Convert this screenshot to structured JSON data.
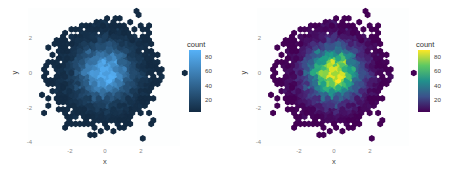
{
  "chart_data": [
    {
      "type": "heatmap",
      "subtype": "hexbin",
      "title": "",
      "xlabel": "x",
      "ylabel": "y",
      "x_ticks": [
        "-2",
        "0",
        "2"
      ],
      "y_ticks": [
        "2",
        "0",
        "-2",
        "-4"
      ],
      "xlim": [
        -3.8,
        3.8
      ],
      "ylim": [
        -4.2,
        3.2
      ],
      "grid": false,
      "legend": {
        "title": "count",
        "position": "right",
        "breaks": [
          "80",
          "60",
          "40",
          "20"
        ],
        "range": [
          1,
          88
        ]
      },
      "palette": {
        "name": "default-blue",
        "low": "#132B43",
        "high": "#56B1F7"
      },
      "description": "2D hexagonal binning of ~10000 bivariate standard normal points; counts peak ~85 near origin and fall off radially to 1 at edges"
    },
    {
      "type": "heatmap",
      "subtype": "hexbin",
      "title": "",
      "xlabel": "x",
      "ylabel": "y",
      "x_ticks": [
        "-2",
        "0",
        "2"
      ],
      "y_ticks": [
        "2",
        "0",
        "-2",
        "-4"
      ],
      "xlim": [
        -3.8,
        3.8
      ],
      "ylim": [
        -4.2,
        3.2
      ],
      "grid": false,
      "legend": {
        "title": "count",
        "position": "right",
        "breaks": [
          "80",
          "60",
          "40",
          "20"
        ],
        "range": [
          1,
          88
        ]
      },
      "palette": {
        "name": "viridis",
        "stops": [
          "#440154",
          "#3B528B",
          "#21908C",
          "#5DC863",
          "#FDE725"
        ]
      },
      "description": "Same hexbin data as left panel rendered with the viridis color scale"
    }
  ],
  "panels": [
    {
      "id": "left",
      "x_axis_title": "x",
      "y_axis_title": "y",
      "x_ticks": [
        "-2",
        "0",
        "2"
      ],
      "y_ticks": [
        "2",
        "0",
        "-2",
        "-4"
      ],
      "legend_title": "count",
      "legend_labels": [
        "80",
        "60",
        "40",
        "20"
      ]
    },
    {
      "id": "right",
      "x_axis_title": "x",
      "y_axis_title": "y",
      "x_ticks": [
        "-2",
        "0",
        "2"
      ],
      "y_ticks": [
        "2",
        "0",
        "-2",
        "-4"
      ],
      "legend_title": "count",
      "legend_labels": [
        "80",
        "60",
        "40",
        "20"
      ]
    }
  ],
  "colors": {
    "blue_low": "#132B43",
    "blue_high": "#56B1F7",
    "viridis": [
      "#440154",
      "#482878",
      "#3E4A89",
      "#31688E",
      "#26828E",
      "#1F9E89",
      "#35B779",
      "#6DCD59",
      "#B4DE2C",
      "#FDE725"
    ],
    "panel_bg": "#ffffff",
    "tick_text": "#8a8a8a"
  }
}
